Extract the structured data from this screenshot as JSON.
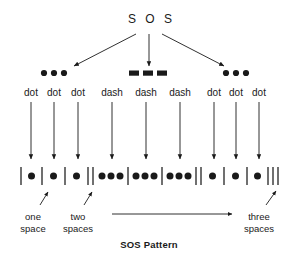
{
  "diagram": {
    "title": "S O S",
    "caption": "SOS Pattern",
    "ink_color": "#1a1a1a",
    "groups": [
      {
        "symbol": "dot-group-left",
        "glyph": "dot",
        "glyph_count": 3,
        "labels": [
          "dot",
          "dot",
          "dot"
        ]
      },
      {
        "symbol": "dash-group-middle",
        "glyph": "dash",
        "glyph_count": 3,
        "labels": [
          "dash",
          "dash",
          "dash"
        ]
      },
      {
        "symbol": "dot-group-right",
        "glyph": "dot",
        "glyph_count": 3,
        "labels": [
          "dot",
          "dot",
          "dot"
        ]
      }
    ],
    "pattern_row": {
      "description": "Morse timing cells separated by vertical bar separators",
      "cells": [
        {
          "kind": "dot",
          "dots": 1
        },
        {
          "kind": "dot",
          "dots": 1
        },
        {
          "kind": "dot",
          "dots": 1
        },
        {
          "kind": "dash",
          "dots": 3
        },
        {
          "kind": "dash",
          "dots": 3
        },
        {
          "kind": "dash",
          "dots": 3
        },
        {
          "kind": "dot",
          "dots": 1
        },
        {
          "kind": "dot",
          "dots": 1
        },
        {
          "kind": "dot",
          "dots": 1
        }
      ],
      "separator_counts": [
        1,
        1,
        1,
        1,
        2,
        1,
        1,
        1,
        2,
        1,
        1,
        1,
        3
      ]
    },
    "annotations": [
      {
        "name": "one-space",
        "line1": "one",
        "line2": "space"
      },
      {
        "name": "two-spaces",
        "line1": "two",
        "line2": "spaces"
      },
      {
        "name": "three-spaces",
        "line1": "three",
        "line2": "spaces"
      }
    ]
  }
}
